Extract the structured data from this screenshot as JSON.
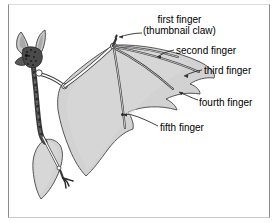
{
  "figure": {
    "background_color": "#ffffff",
    "frame_color": "#8c8c8c",
    "membrane_color": "#d2d2d2",
    "bone_color": "#ffffff",
    "outline_color": "#3a3a3a",
    "text_color": "#000000",
    "leader_color": "#2b2b2b"
  },
  "labels": {
    "first_finger_line1": "first finger",
    "first_finger_line2": "(thumbnail claw)",
    "second_finger": "second finger",
    "third_finger": "third finger",
    "fourth_finger": "fourth finger",
    "fifth_finger": "fifth finger"
  }
}
